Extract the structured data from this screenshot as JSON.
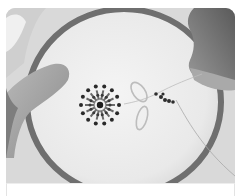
{
  "card": {
    "image": {
      "alt": "Hands stitching beads onto fabric in an embroidery hoop, forming a beaded flower with a lazy-daisy leaf",
      "subject": "bead embroidery in hoop",
      "tone": "grayscale"
    },
    "caption": ""
  }
}
